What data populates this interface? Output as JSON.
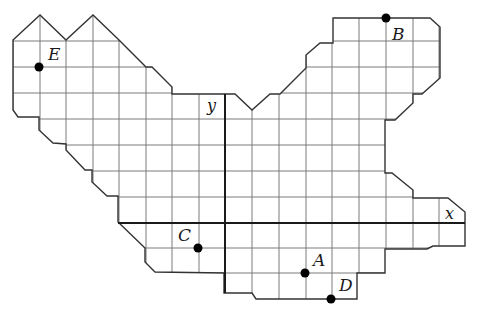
{
  "figure": {
    "type": "coordinate-grid-map",
    "axes": {
      "x_label": "x",
      "y_label": "y"
    },
    "points": [
      {
        "name": "E",
        "label": "E"
      },
      {
        "name": "B",
        "label": "B"
      },
      {
        "name": "C",
        "label": "C"
      },
      {
        "name": "A",
        "label": "A"
      },
      {
        "name": "D",
        "label": "D"
      }
    ]
  }
}
